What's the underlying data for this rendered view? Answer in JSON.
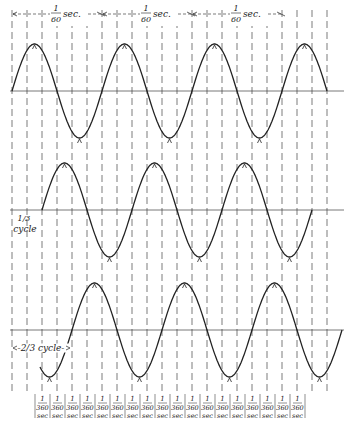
{
  "diagram": {
    "period_labels": [
      {
        "numerator": "1",
        "denominator": "60",
        "unit": "sec."
      },
      {
        "numerator": "1",
        "denominator": "60",
        "unit": "sec."
      },
      {
        "numerator": "1",
        "denominator": "60",
        "unit": "sec."
      }
    ],
    "phase_labels": {
      "middle": {
        "fraction": "1/3",
        "text": "cycle"
      },
      "bottom": {
        "fraction": "2/3",
        "text": "cycle"
      }
    },
    "tick_cells": {
      "count": 18,
      "numerator": "1",
      "denominator": "360",
      "unit": "sec"
    },
    "waves": [
      {
        "name": "phase-1",
        "phase_offset_cycles": 0
      },
      {
        "name": "phase-2",
        "phase_offset_cycles": 0.3333
      },
      {
        "name": "phase-3",
        "phase_offset_cycles": 0.6667
      }
    ],
    "colors": {
      "ink": "#222222",
      "axis": "#555555",
      "dash": "#444444"
    }
  }
}
